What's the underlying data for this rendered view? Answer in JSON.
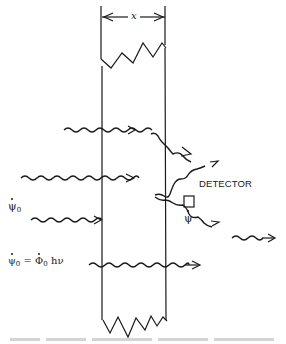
{
  "figure": {
    "dimension_label": "x",
    "detector_label": "DETECTOR",
    "incident_flux_label": {
      "symbol": "ψ",
      "subscript": "0"
    },
    "detected_flux_label": {
      "symbol": "ψ"
    },
    "energy_relation": {
      "lhs_symbol": "ψ",
      "lhs_subscript": "0",
      "equals": "=",
      "rhs_symbol": "Φ",
      "rhs_subscript": "0",
      "rhs_suffix": "hν"
    },
    "elements": [
      "slab-with-thickness-x",
      "incident-photon-absorbed-at-entry",
      "photon-transmitted-into-slab",
      "photon-scattered-out-of-slab",
      "photon-scattered-to-detector",
      "uncollided-photon-transmitted",
      "detector-box"
    ],
    "caption": "(caption text cut off at bottom edge — illegible)"
  }
}
